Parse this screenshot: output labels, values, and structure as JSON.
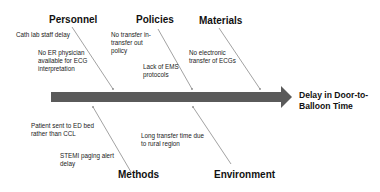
{
  "diagram": {
    "type": "fishbone",
    "effect": {
      "line1": "Delay in Door-to-",
      "line2": "Balloon Time"
    },
    "categories": {
      "personnel": {
        "label": "Personnel",
        "causes": [
          {
            "lines": [
              "Cath lab staff delay"
            ]
          },
          {
            "lines": [
              "No ER physician",
              "available for ECG",
              "interpretation"
            ]
          }
        ]
      },
      "policies": {
        "label": "Policies",
        "causes": [
          {
            "lines": [
              "No transfer in-",
              "transfer out",
              "policy"
            ]
          },
          {
            "lines": [
              "Lack of EMS",
              "protocols"
            ]
          }
        ]
      },
      "materials": {
        "label": "Materials",
        "causes": [
          {
            "lines": [
              "No electronic",
              "transfer of ECGs"
            ]
          }
        ]
      },
      "methods": {
        "label": "Methods",
        "causes": [
          {
            "lines": [
              "Patient sent to ED bed",
              "rather than CCL"
            ]
          },
          {
            "lines": [
              "STEMI paging alert",
              "delay"
            ]
          }
        ]
      },
      "environment": {
        "label": "Environment",
        "causes": [
          {
            "lines": [
              "Long transfer time due",
              "to rural region"
            ]
          }
        ]
      }
    },
    "colors": {
      "spine": "#5a5a5a",
      "bone_lines": "#8a8a8a",
      "text": "#111111"
    }
  }
}
